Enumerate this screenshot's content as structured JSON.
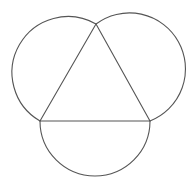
{
  "diagram": {
    "background": "#ffffff",
    "stroke_color": "#555555",
    "triangle": {
      "vertices": [
        [
          96,
          24
        ],
        [
          40,
          121
        ],
        [
          150,
          121
        ]
      ]
    },
    "arcs": [
      {
        "side": "left",
        "from": [
          96,
          24
        ],
        "to": [
          40,
          121
        ],
        "radius": 56
      },
      {
        "side": "right",
        "from": [
          150,
          121
        ],
        "to": [
          96,
          24
        ],
        "radius": 56
      },
      {
        "side": "bottom",
        "from": [
          40,
          121
        ],
        "to": [
          150,
          121
        ],
        "radius": 55
      }
    ]
  }
}
